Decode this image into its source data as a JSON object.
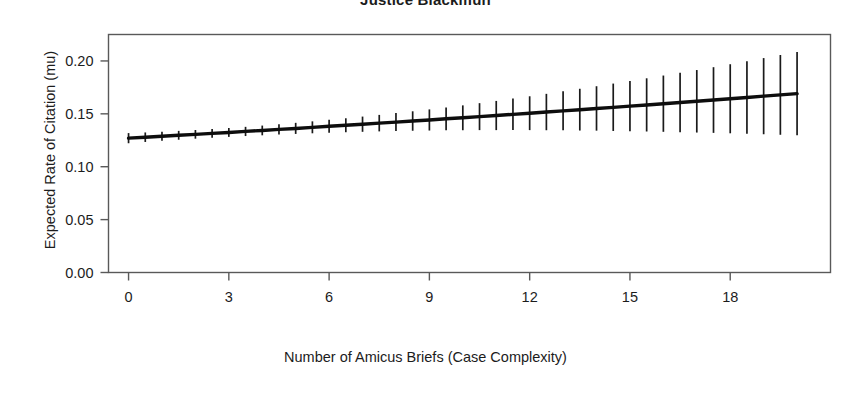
{
  "chart_data": {
    "type": "line",
    "title": "Justice Blackmun",
    "xlabel": "Number of Amicus Briefs (Case Complexity)",
    "ylabel": "Expected Rate of Citation (mu)",
    "xlim": [
      -0.6,
      21.0
    ],
    "ylim": [
      0.0,
      0.225
    ],
    "xticks": [
      0,
      3,
      6,
      9,
      12,
      15,
      18
    ],
    "xtick_labels": [
      "0",
      "3",
      "6",
      "9",
      "12",
      "15",
      "18"
    ],
    "yticks": [
      0.0,
      0.05,
      0.1,
      0.15,
      0.2
    ],
    "ytick_labels": [
      "0.00",
      "0.05",
      "0.10",
      "0.15",
      "0.20"
    ],
    "grid": false,
    "legend": null,
    "series": [
      {
        "name": "Expected rate of citation",
        "style": "line-with-errorbars",
        "x": [
          0.0,
          0.5,
          1.0,
          1.5,
          2.0,
          2.5,
          3.0,
          3.5,
          4.0,
          4.5,
          5.0,
          5.5,
          6.0,
          6.5,
          7.0,
          7.5,
          8.0,
          8.5,
          9.0,
          9.5,
          10.0,
          10.5,
          11.0,
          11.5,
          12.0,
          12.5,
          13.0,
          13.5,
          14.0,
          14.5,
          15.0,
          15.5,
          16.0,
          16.5,
          17.0,
          17.5,
          18.0,
          18.5,
          19.0,
          19.5,
          20.0
        ],
        "y": [
          0.127,
          0.1279,
          0.1288,
          0.1297,
          0.1306,
          0.1315,
          0.1324,
          0.1334,
          0.1343,
          0.1353,
          0.1362,
          0.1372,
          0.1382,
          0.1392,
          0.1402,
          0.1412,
          0.1422,
          0.1432,
          0.1442,
          0.1453,
          0.1463,
          0.1474,
          0.1484,
          0.1495,
          0.1506,
          0.1517,
          0.1528,
          0.1539,
          0.155,
          0.1561,
          0.1573,
          0.1584,
          0.1596,
          0.1607,
          0.1619,
          0.1631,
          0.1643,
          0.1655,
          0.1667,
          0.1679,
          0.1691
        ],
        "y_lower": [
          0.1222,
          0.1234,
          0.1245,
          0.1255,
          0.1265,
          0.1274,
          0.1282,
          0.129,
          0.1297,
          0.1304,
          0.131,
          0.1316,
          0.1321,
          0.1326,
          0.133,
          0.1334,
          0.1337,
          0.134,
          0.1342,
          0.1344,
          0.1345,
          0.1346,
          0.1346,
          0.1346,
          0.1346,
          0.1345,
          0.1344,
          0.1342,
          0.1341,
          0.1338,
          0.1336,
          0.1333,
          0.133,
          0.1327,
          0.1323,
          0.132,
          0.1316,
          0.1311,
          0.1307,
          0.1302,
          0.1298
        ],
        "y_upper": [
          0.1318,
          0.1324,
          0.1331,
          0.1339,
          0.1347,
          0.1356,
          0.1366,
          0.1377,
          0.1389,
          0.1402,
          0.1415,
          0.1429,
          0.1443,
          0.1458,
          0.1474,
          0.149,
          0.1507,
          0.1524,
          0.1542,
          0.1561,
          0.158,
          0.1601,
          0.1622,
          0.1644,
          0.1666,
          0.1689,
          0.1713,
          0.1737,
          0.1761,
          0.1786,
          0.1811,
          0.1836,
          0.1862,
          0.1888,
          0.1914,
          0.1941,
          0.1969,
          0.1998,
          0.2027,
          0.2056,
          0.2085
        ]
      }
    ]
  }
}
